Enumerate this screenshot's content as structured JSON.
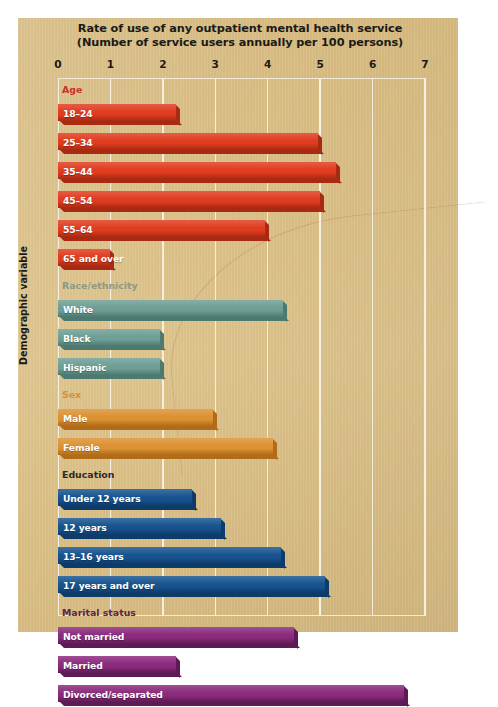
{
  "chart_data": {
    "type": "bar",
    "orientation": "horizontal",
    "title": "Rate of use of any outpatient mental health service (Number of service users annually per 100 persons)",
    "title_line1": "Rate of use of any outpatient mental health service",
    "title_line2": "(Number of service users annually per 100 persons)",
    "xlabel": "",
    "ylabel": "Demographic variable",
    "xlim": [
      0,
      7
    ],
    "grid": true,
    "legend": "none",
    "tick_labels": [
      "0",
      "1",
      "2",
      "3",
      "4",
      "5",
      "6",
      "7"
    ],
    "categories": [
      "18–24",
      "25–34",
      "35–44",
      "45–54",
      "55–64",
      "65 and over",
      "White",
      "Black",
      "Hispanic",
      "Male",
      "Female",
      "Under 12 years",
      "12 years",
      "13–16 years",
      "17 years and over",
      "Not married",
      "Married",
      "Divorced/separated"
    ],
    "values": [
      2.25,
      4.95,
      5.3,
      5.0,
      3.95,
      1.0,
      4.3,
      1.95,
      1.95,
      2.95,
      4.1,
      2.55,
      3.1,
      4.25,
      5.1,
      4.5,
      2.25,
      6.6
    ],
    "groups": [
      {
        "name": "Age",
        "header_color": "#c8332a",
        "bar_color": "#e03c1f",
        "bar_color_dark": "#a82a12",
        "items": [
          {
            "label": "18–24",
            "value": 2.25
          },
          {
            "label": "25–34",
            "value": 4.95
          },
          {
            "label": "35–44",
            "value": 5.3
          },
          {
            "label": "45–54",
            "value": 5.0
          },
          {
            "label": "55–64",
            "value": 3.95
          },
          {
            "label": "65 and over",
            "value": 1.0
          }
        ]
      },
      {
        "name": "Race/ethnicity",
        "header_color": "#8b9a87",
        "bar_color": "#6e9e95",
        "bar_color_dark": "#4c7a71",
        "items": [
          {
            "label": "White",
            "value": 4.3
          },
          {
            "label": "Black",
            "value": 1.95
          },
          {
            "label": "Hispanic",
            "value": 1.95
          }
        ]
      },
      {
        "name": "Sex",
        "header_color": "#d2923c",
        "bar_color": "#dc9133",
        "bar_color_dark": "#b06c18",
        "items": [
          {
            "label": "Male",
            "value": 2.95
          },
          {
            "label": "Female",
            "value": 4.1
          }
        ]
      },
      {
        "name": "Education",
        "header_color": "#2b2a28",
        "bar_color": "#17548f",
        "bar_color_dark": "#0d3b6a",
        "items": [
          {
            "label": "Under 12 years",
            "value": 2.55
          },
          {
            "label": "12 years",
            "value": 3.1
          },
          {
            "label": "13–16 years",
            "value": 4.25
          },
          {
            "label": "17 years and over",
            "value": 5.1
          }
        ]
      },
      {
        "name": "Marital status",
        "header_color": "#5d2550",
        "bar_color": "#8b2b7d",
        "bar_color_dark": "#5e1a54",
        "items": [
          {
            "label": "Not married",
            "value": 4.5
          },
          {
            "label": "Married",
            "value": 2.25
          },
          {
            "label": "Divorced/separated",
            "value": 6.6
          }
        ]
      }
    ]
  },
  "colors": {
    "panel_background": "#dcc088",
    "gridline": "#f6efdd",
    "text": "#1b1a16"
  }
}
